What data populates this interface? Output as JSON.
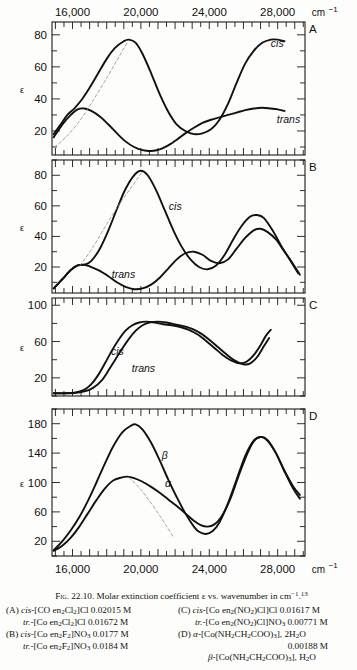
{
  "figure": {
    "label": "Fig. 22.10.",
    "title_text": "Molar extinction coefficient ε vs. wavenumber in cm",
    "title_exponent": "−1",
    "title_refmark": "13",
    "y_axis_symbol": "ε",
    "x_axis_unit": "cm",
    "x_axis_unit_exp": "−1",
    "x_ticks_labeled": [
      "16,000",
      "20,000",
      "24,000",
      "28,000"
    ],
    "x_min": 14800,
    "x_max": 29600,
    "minor_tick_step": 500,
    "panels": [
      "A",
      "B",
      "C",
      "D"
    ]
  },
  "caption": {
    "entries": [
      {
        "key": "(A)",
        "lines": [
          {
            "prefix": "cis",
            "text": "-[CO en",
            "sub1": "2",
            "mid": "Cl",
            "sub2": "2",
            "tail": "]Cl 0.02015 M"
          },
          {
            "prefix": "tr.",
            "text": "-[Co en",
            "sub1": "2",
            "mid": "Cl",
            "sub2": "2",
            "tail": "]Cl 0.01672 M"
          }
        ]
      },
      {
        "key": "(B)",
        "lines": [
          {
            "prefix": "cis",
            "text": "-[Co en",
            "sub1": "2",
            "mid": "F",
            "sub2": "2",
            "tail": "]NO",
            "sub3": "3",
            "tail2": " 0.0177 M"
          },
          {
            "prefix": "tr.",
            "text": "-[Co en",
            "sub1": "2",
            "mid": "F",
            "sub2": "2",
            "tail": "]NO",
            "sub3": "3",
            "tail2": " 0.0184 M"
          }
        ]
      },
      {
        "key": "(C)",
        "lines": [
          {
            "prefix": "cis",
            "text": "-[Co en",
            "sub1": "2",
            "mid": "(NO",
            "sub2": "2",
            "tail": ")Cl]Cl 0.01617 M"
          },
          {
            "prefix": "tr.",
            "text": "-[Co en",
            "sub1": "2",
            "mid": "(NO",
            "sub2": "2",
            "tail": ")Cl]NO",
            "sub3": "3",
            "tail2": " 0.00771 M"
          }
        ]
      },
      {
        "key": "(D)",
        "lines": [
          {
            "prefix": "α",
            "text": "-[Co(NH",
            "sub1": "2",
            "mid": "CH",
            "sub2": "2",
            "tail": "COO)",
            "sub3": "3",
            "tail2": "], 2H",
            "sub4": "2",
            "tail3": "O"
          },
          {
            "conc": "0.00188 M"
          },
          {
            "prefix": "β",
            "text": "-[Co(NH",
            "sub1": "2",
            "mid": "CH",
            "sub2": "2",
            "tail": "COO)",
            "sub3": "3",
            "tail2": "], H",
            "sub4": "2",
            "tail3": "O"
          }
        ]
      }
    ]
  },
  "chart_data": [
    {
      "panel": "A",
      "type": "line",
      "title": "",
      "xlabel": "wavenumber (cm^-1)",
      "ylabel": "ε",
      "xlim": [
        14800,
        29600
      ],
      "ylim": [
        5,
        88
      ],
      "yticks": [
        20,
        40,
        60,
        80
      ],
      "grid": false,
      "legend": [
        "cis",
        "trans"
      ],
      "legend_position": "inline-annotation",
      "series": [
        {
          "name": "cis",
          "style": "solid",
          "x": [
            14900,
            15300,
            15700,
            16100,
            16500,
            17000,
            17500,
            18000,
            18500,
            19000,
            19300,
            19700,
            20100,
            20600,
            21100,
            21600,
            22100,
            22600,
            23100,
            23600,
            24100,
            24600,
            25100,
            25600,
            26100,
            26600,
            27100,
            27600,
            28000,
            28400
          ],
          "y": [
            18,
            24,
            30,
            34,
            39,
            47,
            56,
            65,
            72,
            76,
            77,
            75,
            68,
            56,
            43,
            32,
            24,
            20,
            18,
            18.5,
            21,
            27,
            37,
            50,
            62,
            70,
            75,
            77,
            77,
            76
          ]
        },
        {
          "name": "trans",
          "style": "solid",
          "x": [
            14900,
            15400,
            15900,
            16300,
            16700,
            17100,
            17600,
            18100,
            18600,
            19100,
            19600,
            20100,
            20600,
            21100,
            21600,
            22100,
            22600,
            23100,
            23600,
            24100,
            24600,
            25100,
            25600,
            26100,
            26600,
            27100,
            27600,
            28000,
            28400
          ],
          "y": [
            16,
            24,
            30,
            33.5,
            34,
            32.5,
            29,
            24,
            18.5,
            13.5,
            10,
            8,
            7.5,
            8.5,
            11,
            14.5,
            18.5,
            22,
            25,
            27,
            28.5,
            30,
            31.5,
            33,
            34,
            34.5,
            34,
            33.5,
            32.5
          ]
        },
        {
          "name": "cis-shoulder-construction",
          "style": "dashed",
          "x": [
            14950,
            15600,
            16400,
            17200,
            18000,
            18700,
            19250
          ],
          "y": [
            10,
            16,
            26,
            39,
            53,
            66,
            76
          ]
        }
      ]
    },
    {
      "panel": "B",
      "type": "line",
      "xlim": [
        14800,
        29600
      ],
      "ylim": [
        3,
        90
      ],
      "yticks": [
        20,
        40,
        60,
        80
      ],
      "grid": false,
      "legend": [
        "cis",
        "trans"
      ],
      "legend_position": "inline-annotation",
      "series": [
        {
          "name": "cis",
          "style": "solid",
          "x": [
            14900,
            15400,
            15900,
            16300,
            16700,
            17100,
            17600,
            18100,
            18600,
            19100,
            19600,
            20000,
            20400,
            20900,
            21400,
            21900,
            22400,
            22900,
            23400,
            23900,
            24400,
            24900,
            25400,
            25900,
            26400,
            26800,
            27200,
            27700,
            28200,
            28700,
            29200
          ],
          "y": [
            6,
            12,
            18,
            21,
            21.5,
            24,
            32,
            44,
            58,
            71,
            80,
            83,
            80,
            70,
            57,
            44,
            33,
            25,
            20,
            18.5,
            21,
            28,
            38,
            47,
            53,
            54,
            52,
            44,
            34,
            25,
            16
          ]
        },
        {
          "name": "trans",
          "style": "solid",
          "x": [
            14900,
            15400,
            15900,
            16300,
            16700,
            17100,
            17600,
            18100,
            18600,
            19100,
            19600,
            20100,
            20600,
            21100,
            21600,
            22100,
            22600,
            23100,
            23600,
            24100,
            24600,
            25100,
            25600,
            26100,
            26600,
            27000,
            27400,
            27900,
            28400,
            28900,
            29300
          ],
          "y": [
            6,
            12,
            18,
            21,
            21.5,
            20,
            17.5,
            14,
            10,
            7,
            5.5,
            6,
            8.5,
            13,
            19,
            25,
            29,
            30,
            28,
            24,
            22.5,
            25,
            32,
            39,
            44,
            45,
            43,
            38,
            30,
            22,
            15
          ]
        },
        {
          "name": "cis-shoulder-construction",
          "style": "dashed",
          "x": [
            16450,
            17200,
            18000,
            18800,
            19500,
            20050
          ],
          "y": [
            21,
            33,
            48,
            62,
            73,
            82
          ]
        }
      ]
    },
    {
      "panel": "C",
      "type": "line",
      "xlim": [
        14800,
        29600
      ],
      "ylim": [
        0,
        108
      ],
      "yticks": [
        20,
        60,
        100
      ],
      "grid": false,
      "legend": [
        "cis",
        "trans"
      ],
      "legend_position": "inline-annotation",
      "series": [
        {
          "name": "cis",
          "style": "solid",
          "x": [
            14900,
            15600,
            16200,
            16700,
            17100,
            17500,
            17900,
            18300,
            18700,
            19100,
            19500,
            19900,
            20300,
            20800,
            21300,
            21800,
            22300,
            22800,
            23300,
            23800,
            24300,
            24800,
            25300,
            25800,
            26200,
            26600,
            27000,
            27300,
            27600
          ],
          "y": [
            3,
            3,
            4,
            7,
            13,
            23,
            36,
            50,
            62,
            72,
            78,
            81,
            82,
            81,
            79,
            78,
            76,
            73,
            68,
            61,
            53,
            45,
            39,
            36,
            38,
            45,
            56,
            66,
            73
          ]
        },
        {
          "name": "trans",
          "style": "solid",
          "x": [
            14900,
            15600,
            16200,
            16700,
            17200,
            17700,
            18100,
            18500,
            18900,
            19300,
            19700,
            20100,
            20500,
            21000,
            21500,
            22000,
            22500,
            23000,
            23500,
            24000,
            24500,
            25000,
            25500,
            26000,
            26400,
            26800,
            27200,
            27500
          ],
          "y": [
            3,
            3,
            3.5,
            5,
            9,
            17,
            28,
            40,
            52,
            63,
            72,
            78,
            81,
            82,
            81,
            79,
            77,
            74,
            69,
            62,
            54,
            46,
            39,
            35,
            36,
            43,
            55,
            64
          ]
        }
      ]
    },
    {
      "panel": "D",
      "type": "line",
      "xlim": [
        14800,
        29600
      ],
      "ylim": [
        0,
        200
      ],
      "yticks": [
        20,
        60,
        100,
        140,
        180
      ],
      "grid": false,
      "legend": [
        "β",
        "α"
      ],
      "legend_position": "inline-annotation",
      "series": [
        {
          "name": "beta",
          "style": "solid",
          "x": [
            14900,
            15400,
            15900,
            16400,
            16900,
            17400,
            17900,
            18400,
            18900,
            19400,
            19700,
            20100,
            20600,
            21100,
            21600,
            22100,
            22600,
            23100,
            23400,
            23800,
            24200,
            24600,
            25100,
            25600,
            26100,
            26600,
            27000,
            27400,
            27900,
            28400,
            28900,
            29300
          ],
          "y": [
            8,
            20,
            35,
            53,
            75,
            100,
            126,
            150,
            168,
            177,
            179,
            172,
            154,
            130,
            104,
            80,
            58,
            40,
            33,
            30,
            34,
            46,
            72,
            104,
            136,
            157,
            162,
            158,
            140,
            115,
            92,
            78
          ]
        },
        {
          "name": "alpha",
          "style": "solid",
          "x": [
            14900,
            15400,
            15900,
            16400,
            16900,
            17400,
            17900,
            18400,
            18900,
            19200,
            19600,
            20100,
            20600,
            21100,
            21600,
            22100,
            22600,
            23100,
            23500,
            23900,
            24300,
            24700,
            25200,
            25700,
            26200,
            26600,
            27000,
            27400,
            27900,
            28400,
            28900,
            29300
          ],
          "y": [
            7,
            14,
            25,
            40,
            58,
            76,
            92,
            103,
            107,
            108,
            106,
            101,
            94,
            86,
            77,
            68,
            58,
            48,
            42,
            40,
            43,
            53,
            76,
            108,
            138,
            156,
            162,
            157,
            140,
            116,
            95,
            83
          ]
        },
        {
          "name": "alpha-shoulder-construction",
          "style": "dashed",
          "x": [
            19300,
            19900,
            20500,
            21100,
            21600,
            21900
          ],
          "y": [
            107,
            93,
            75,
            55,
            37,
            26
          ]
        }
      ]
    }
  ]
}
